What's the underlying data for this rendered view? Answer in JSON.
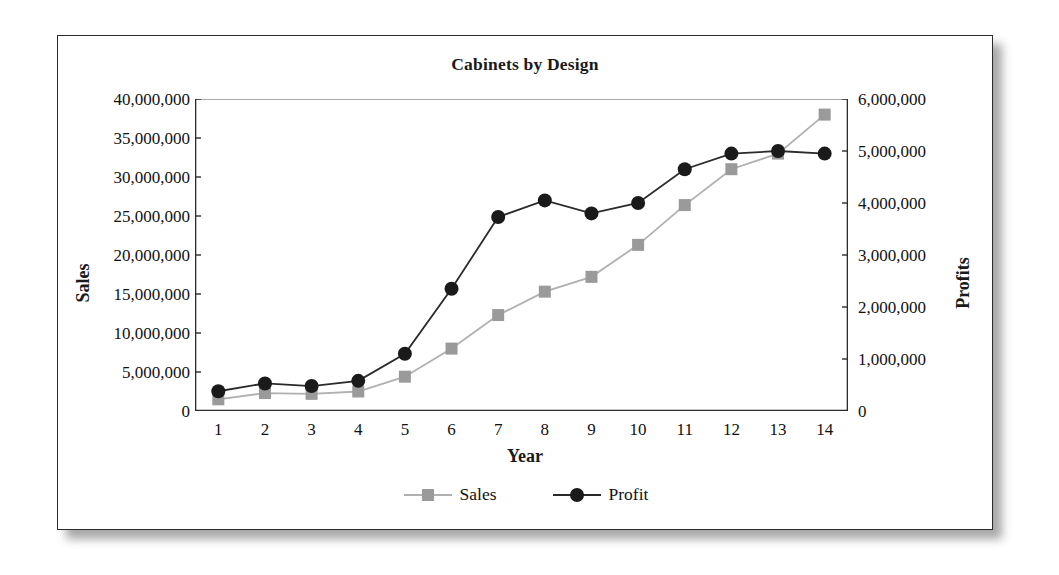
{
  "chart_data": {
    "type": "line",
    "title": "Cabinets by Design",
    "xlabel": "Year",
    "ylabel": "Sales",
    "y2label": "Profits",
    "categories": [
      "1",
      "2",
      "3",
      "4",
      "5",
      "6",
      "7",
      "8",
      "9",
      "10",
      "11",
      "12",
      "13",
      "14"
    ],
    "ylim": [
      0,
      40000000
    ],
    "y2lim": [
      0,
      6000000
    ],
    "yticks": [
      "0",
      "5,000,000",
      "10,000,000",
      "15,000,000",
      "20,000,000",
      "25,000,000",
      "30,000,000",
      "35,000,000",
      "40,000,000"
    ],
    "ytick_values": [
      0,
      5000000,
      10000000,
      15000000,
      20000000,
      25000000,
      30000000,
      35000000,
      40000000
    ],
    "y2ticks": [
      "0",
      "1,000,000",
      "2,000,000",
      "3,000,000",
      "4,000,000",
      "5,000,000",
      "6,000,000"
    ],
    "y2tick_values": [
      0,
      1000000,
      2000000,
      3000000,
      4000000,
      5000000,
      6000000
    ],
    "grid": "top-line-only",
    "legend_position": "bottom-center",
    "series": [
      {
        "name": "Sales",
        "axis": "left",
        "marker": "square",
        "color": "#9a9a9a",
        "line_color": "#b0b0b0",
        "values": [
          1500000,
          2300000,
          2200000,
          2500000,
          4400000,
          8000000,
          12300000,
          15300000,
          17200000,
          21300000,
          26400000,
          31000000,
          33000000,
          38000000
        ]
      },
      {
        "name": "Profit",
        "axis": "right",
        "marker": "circle",
        "color": "#1a1a1a",
        "line_color": "#2a2a2a",
        "values": [
          380000,
          530000,
          480000,
          580000,
          1100000,
          2350000,
          3730000,
          4050000,
          3800000,
          4000000,
          4650000,
          4950000,
          5000000,
          4950000
        ]
      }
    ]
  },
  "figure": {
    "border_color": "#2b2b2b",
    "background": "#ffffff"
  }
}
